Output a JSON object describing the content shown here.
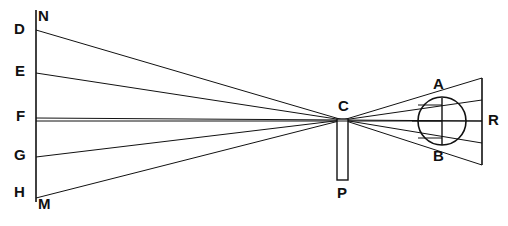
{
  "figure": {
    "stroke_color": "#111111",
    "background_color": "#ffffff",
    "width": 508,
    "height": 226
  },
  "labels": {
    "N": "N",
    "D": "D",
    "E": "E",
    "F": "F",
    "G": "G",
    "H": "H",
    "M": "M",
    "C": "C",
    "P": "P",
    "A": "A",
    "B": "B",
    "R": "R"
  },
  "geometry": {
    "object_line": {
      "x": 36,
      "y1": 10,
      "y2": 202
    },
    "screen_line": {
      "x": 482,
      "y1": 78,
      "y2": 165
    },
    "pinhole": {
      "x": 343,
      "y": 120
    },
    "aperture_bar": {
      "x": 337,
      "y": 119,
      "w": 11,
      "h": 61
    },
    "eye": {
      "cx": 442,
      "cy": 121,
      "r": 24
    },
    "chord_AB": {
      "x": 442,
      "y1": 98,
      "y2": 145
    },
    "axis": {
      "y": 121
    },
    "object_points": [
      {
        "name": "D",
        "x": 36,
        "y": 30
      },
      {
        "name": "E",
        "x": 36,
        "y": 73
      },
      {
        "name": "F",
        "x": 36,
        "y": 118
      },
      {
        "name": "G",
        "x": 36,
        "y": 157
      },
      {
        "name": "M",
        "x": 36,
        "y": 198
      }
    ],
    "image_points": [
      {
        "name": "d",
        "x": 482,
        "y": 165
      },
      {
        "name": "e",
        "x": 482,
        "y": 143
      },
      {
        "name": "f",
        "x": 482,
        "y": 121
      },
      {
        "name": "g",
        "x": 482,
        "y": 100
      },
      {
        "name": "m",
        "x": 482,
        "y": 78
      }
    ],
    "inner_marks": [
      {
        "x1": 418,
        "y1": 105,
        "x2": 442,
        "y2": 105
      },
      {
        "x1": 412,
        "y1": 121,
        "x2": 442,
        "y2": 121
      },
      {
        "x1": 418,
        "y1": 138,
        "x2": 442,
        "y2": 138
      }
    ]
  },
  "label_positions": {
    "N": {
      "x": 38,
      "y": 8
    },
    "D": {
      "x": 14,
      "y": 21
    },
    "E": {
      "x": 15,
      "y": 63
    },
    "F": {
      "x": 16,
      "y": 108
    },
    "G": {
      "x": 14,
      "y": 147
    },
    "H": {
      "x": 14,
      "y": 184
    },
    "M": {
      "x": 38,
      "y": 196
    },
    "C": {
      "x": 338,
      "y": 98
    },
    "P": {
      "x": 337,
      "y": 185
    },
    "A": {
      "x": 433,
      "y": 76
    },
    "B": {
      "x": 433,
      "y": 148
    },
    "R": {
      "x": 488,
      "y": 112
    }
  }
}
